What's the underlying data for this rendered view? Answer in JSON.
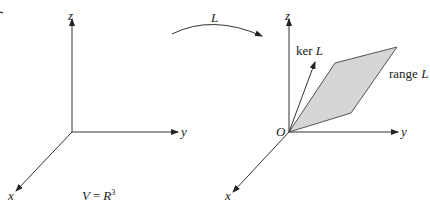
{
  "left_system": {
    "axes": {
      "x": "x",
      "y": "y",
      "z": "z"
    },
    "caption": "V = R",
    "caption_sup": "3"
  },
  "mapping": {
    "label": "L"
  },
  "right_system": {
    "axes": {
      "x": "x",
      "y": "y",
      "z": "z"
    },
    "origin": "O",
    "kernel_label_prefix": "ker ",
    "kernel_label_var": "L",
    "range_label_prefix": "range ",
    "range_label_var": "L"
  },
  "colors": {
    "line": "#333333",
    "plane_fill": "#d6d6d6",
    "plane_edge": "#555555"
  }
}
